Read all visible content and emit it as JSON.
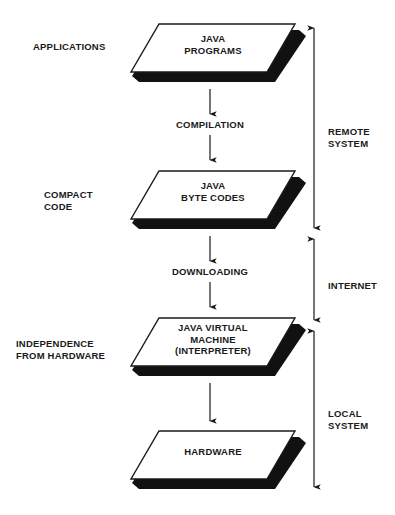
{
  "diagram": {
    "colors": {
      "ink": "#1a1a1a",
      "shadow": "#111111",
      "face": "#ffffff",
      "background": "#ffffff"
    },
    "layers": [
      {
        "id": "java-programs",
        "left_label": "APPLICATIONS",
        "text": "JAVA\nPROGRAMS"
      },
      {
        "id": "java-byte-codes",
        "left_label": "COMPACT\nCODE",
        "text": "JAVA\nBYTE CODES"
      },
      {
        "id": "java-virtual-machine",
        "left_label": "INDEPENDENCE\nFROM HARDWARE",
        "text": "JAVA VIRTUAL\nMACHINE\n(INTERPRETER)"
      },
      {
        "id": "hardware",
        "left_label": "",
        "text": "HARDWARE"
      }
    ],
    "transitions": [
      {
        "id": "compilation",
        "label": "COMPILATION"
      },
      {
        "id": "downloading",
        "label": "DOWNLOADING"
      },
      {
        "id": "execution",
        "label": ""
      }
    ],
    "scopes": [
      {
        "id": "remote-system",
        "label": "REMOTE\nSYSTEM"
      },
      {
        "id": "internet",
        "label": "INTERNET"
      },
      {
        "id": "local-system",
        "label": "LOCAL\nSYSTEM"
      }
    ]
  }
}
